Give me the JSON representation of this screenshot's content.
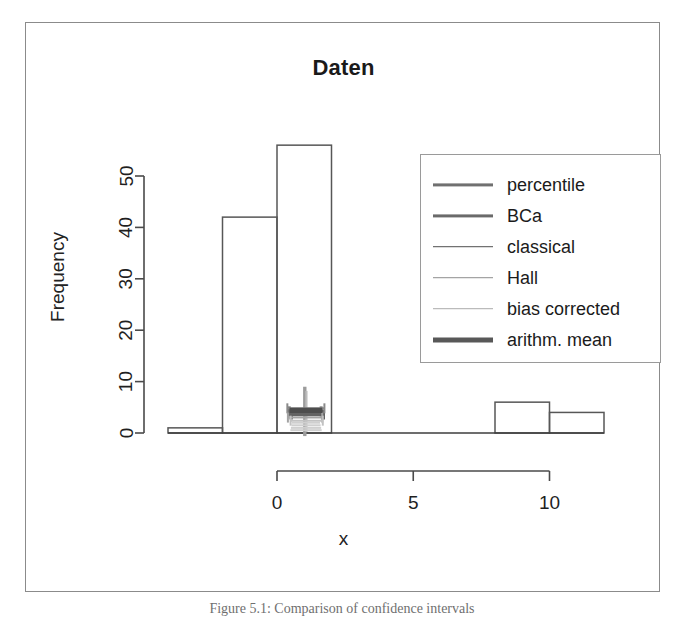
{
  "figure": {
    "caption": "Figure 5.1: Comparison of confidence intervals"
  },
  "chart": {
    "title": "Daten",
    "xlabel": "x",
    "ylabel": "Frequency"
  },
  "axes": {
    "y_ticks": [
      "0",
      "10",
      "20",
      "30",
      "40",
      "50"
    ],
    "x_ticks": [
      "0",
      "5",
      "10"
    ]
  },
  "legend": {
    "entries": [
      {
        "label": "percentile",
        "color": "#707070",
        "width": 3.2
      },
      {
        "label": "BCa",
        "color": "#6a6a6a",
        "width": 3.2
      },
      {
        "label": "classical",
        "color": "#4f4f4f",
        "width": 1.6
      },
      {
        "label": "Hall",
        "color": "#8e8e8e",
        "width": 1.6
      },
      {
        "label": "bias corrected",
        "color": "#ababab",
        "width": 1.6
      },
      {
        "label": "arithm. mean",
        "color": "#585858",
        "width": 5.0
      }
    ]
  },
  "chart_data": {
    "type": "bar",
    "title": "Daten",
    "xlabel": "x",
    "ylabel": "Frequency",
    "grid": false,
    "legend_position": "top-right",
    "xlim": [
      -4,
      12
    ],
    "ylim": [
      0,
      56
    ],
    "y_ticks": [
      0,
      10,
      20,
      30,
      40,
      50
    ],
    "x_ticks": [
      0,
      5,
      10
    ],
    "bin_width": 2,
    "bin_edges": [
      -4,
      -2,
      0,
      2,
      4,
      6,
      8,
      10,
      12
    ],
    "categories": [
      "[-4,-2)",
      "[-2,0)",
      "[0,2)",
      "[2,4)",
      "[4,6)",
      "[6,8)",
      "[8,10)",
      "[10,12)"
    ],
    "values": [
      1,
      42,
      56,
      0,
      0,
      0,
      6,
      4
    ],
    "annotations": [
      {
        "name": "confidence-interval-overlay",
        "description": "Cluster of overlapping bootstrap confidence interval brackets and arithmetic mean marker drawn near x = 1, y ~ 0 to 9",
        "x_center": 1.0,
        "y_range": [
          0,
          9
        ]
      }
    ],
    "series": [
      {
        "name": "percentile",
        "type": "interval",
        "x": [
          0.45,
          1.62
        ],
        "y": 4.2
      },
      {
        "name": "BCa",
        "type": "interval",
        "x": [
          0.52,
          1.7
        ],
        "y": 3.6
      },
      {
        "name": "classical",
        "type": "interval",
        "x": [
          0.38,
          1.74
        ],
        "y": 4.8
      },
      {
        "name": "Hall",
        "type": "interval",
        "x": [
          0.4,
          1.66
        ],
        "y": 3.0
      },
      {
        "name": "bias corrected",
        "type": "interval",
        "x": [
          0.5,
          1.68
        ],
        "y": 2.4
      },
      {
        "name": "arithm. mean",
        "type": "point",
        "x": [
          1.05
        ],
        "y": 4.4
      }
    ]
  }
}
